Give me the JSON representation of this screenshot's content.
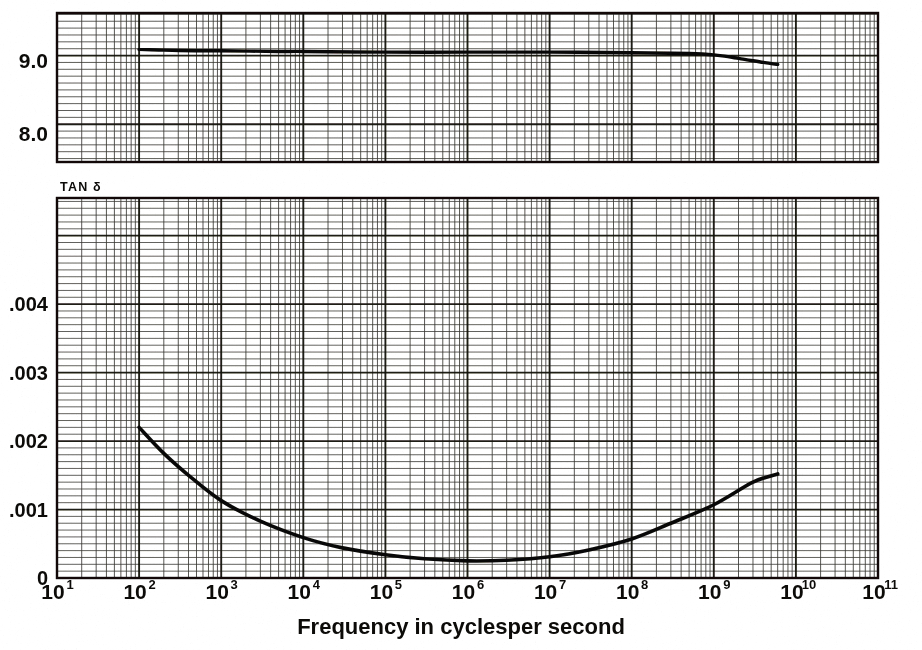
{
  "figure": {
    "kind": "scanned-graph-paper",
    "background_color": "#ffffff",
    "ink_color": "#121110",
    "grid_color": "#2b2a27",
    "caption": "Frequency in cyclesper second",
    "panel_tag": "TAN δ"
  },
  "axis": {
    "x_label": "Frequency in cyclesper second",
    "x_scale": "log",
    "x_min_decade": 1,
    "x_max_decade": 11,
    "x_tick_labels": [
      {
        "mantissa": "10",
        "exponent": "1"
      },
      {
        "mantissa": "10",
        "exponent": "2"
      },
      {
        "mantissa": "10",
        "exponent": "3"
      },
      {
        "mantissa": "10",
        "exponent": "4"
      },
      {
        "mantissa": "10",
        "exponent": "5"
      },
      {
        "mantissa": "10",
        "exponent": "6"
      },
      {
        "mantissa": "10",
        "exponent": "7"
      },
      {
        "mantissa": "10",
        "exponent": "8"
      },
      {
        "mantissa": "10",
        "exponent": "9"
      },
      {
        "mantissa": "10",
        "exponent": "10"
      },
      {
        "mantissa": "10",
        "exponent": "11"
      }
    ]
  },
  "chart_data": [
    {
      "type": "line",
      "id": "dielectric-constant-panel",
      "title": "",
      "xlabel": "Frequency in cyclesper second",
      "ylabel": "",
      "xscale": "log",
      "xlim": [
        10,
        100000000000
      ],
      "ylim": [
        7.45,
        9.62
      ],
      "grid": true,
      "y_tick_labels": [
        "9.0",
        "8.0"
      ],
      "y_tick_values": [
        9.0,
        8.0
      ],
      "series": [
        {
          "name": "dielectric constant",
          "x": [
            100,
            200,
            500,
            1000,
            5000,
            10000,
            100000,
            1000000,
            10000000,
            100000000,
            500000000,
            1000000000,
            2000000000,
            4000000000,
            6000000000
          ],
          "y": [
            9.09,
            9.08,
            9.07,
            9.07,
            9.06,
            9.06,
            9.05,
            9.05,
            9.05,
            9.04,
            9.03,
            9.01,
            8.96,
            8.9,
            8.87
          ]
        }
      ]
    },
    {
      "type": "line",
      "id": "tan-delta-panel",
      "title": "TAN δ",
      "xlabel": "Frequency in cyclesper second",
      "ylabel": "TAN δ",
      "xscale": "log",
      "xlim": [
        10,
        100000000000
      ],
      "ylim": [
        0,
        0.00555
      ],
      "grid": true,
      "y_tick_labels": [
        ".004",
        ".003",
        ".002",
        ".001",
        "0"
      ],
      "y_tick_values": [
        0.004,
        0.003,
        0.002,
        0.001,
        0
      ],
      "series": [
        {
          "name": "tan delta",
          "x": [
            100,
            200,
            400,
            1000,
            3000,
            10000,
            30000,
            100000,
            300000,
            1000000,
            3000000,
            10000000,
            30000000,
            100000000,
            300000000,
            1000000000,
            3000000000,
            6000000000
          ],
          "y": [
            0.0022,
            0.00182,
            0.0015,
            0.00113,
            0.00083,
            0.00059,
            0.00044,
            0.00034,
            0.00028,
            0.00025,
            0.00026,
            0.00031,
            0.00041,
            0.00057,
            0.0008,
            0.00107,
            0.0014,
            0.00152
          ]
        }
      ]
    }
  ]
}
